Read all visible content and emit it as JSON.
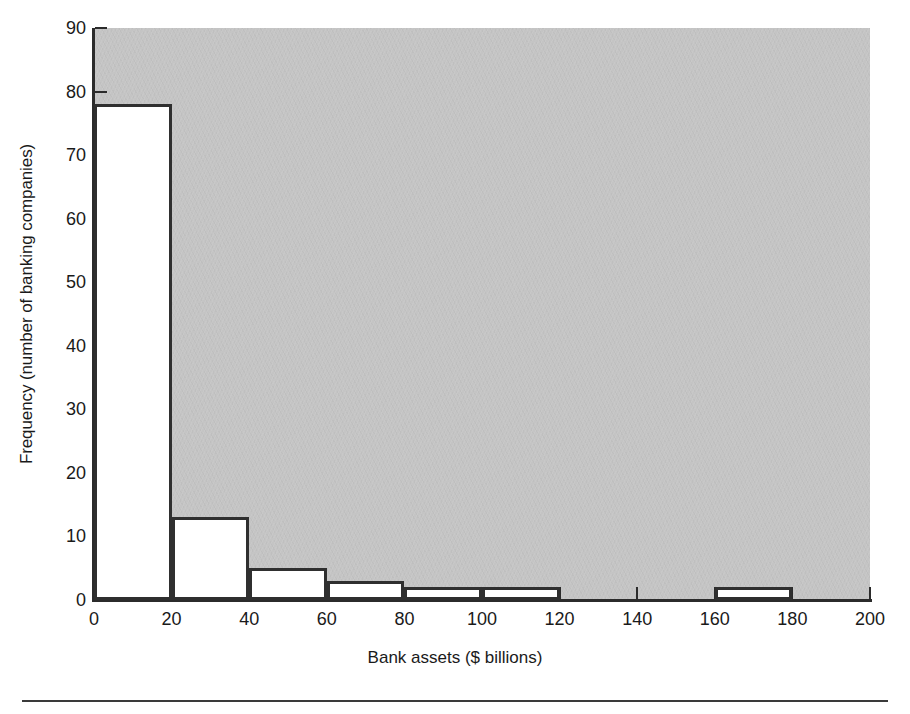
{
  "chart_data": {
    "type": "bar",
    "title": "",
    "subtitle": "",
    "xlabel": "Bank assets ($ billions)",
    "ylabel": "Frequency (number of banking companies)",
    "xlim": [
      0,
      200
    ],
    "ylim": [
      0,
      90
    ],
    "x_ticks": [
      0,
      20,
      40,
      60,
      80,
      100,
      120,
      140,
      160,
      180,
      200
    ],
    "x_tick_labels": [
      "0",
      "20",
      "40",
      "60",
      "80",
      "100",
      "120",
      "140",
      "160",
      "180",
      "200"
    ],
    "y_ticks": [
      0,
      10,
      20,
      30,
      40,
      50,
      60,
      70,
      80,
      90
    ],
    "y_tick_labels": [
      "0",
      "10",
      "20",
      "30",
      "40",
      "50",
      "60",
      "70",
      "80",
      "90"
    ],
    "grid": false,
    "legend": "none",
    "bin_width": 20,
    "bin_edges": [
      0,
      20,
      40,
      60,
      80,
      100,
      120,
      140,
      160,
      180,
      200
    ],
    "categories": [
      "0-20",
      "20-40",
      "40-60",
      "60-80",
      "80-100",
      "100-120",
      "120-140",
      "140-160",
      "160-180",
      "180-200"
    ],
    "values": [
      78,
      13,
      5,
      3,
      2,
      2,
      0,
      0,
      2,
      0
    ],
    "bars": [
      {
        "label": "0-20",
        "x0": 0,
        "x1": 20,
        "value": 78
      },
      {
        "label": "20-40",
        "x0": 20,
        "x1": 40,
        "value": 13
      },
      {
        "label": "40-60",
        "x0": 40,
        "x1": 60,
        "value": 5
      },
      {
        "label": "60-80",
        "x0": 60,
        "x1": 80,
        "value": 3
      },
      {
        "label": "80-100",
        "x0": 80,
        "x1": 100,
        "value": 2
      },
      {
        "label": "100-120",
        "x0": 100,
        "x1": 120,
        "value": 2
      },
      {
        "label": "120-140",
        "x0": 120,
        "x1": 140,
        "value": 0
      },
      {
        "label": "140-160",
        "x0": 140,
        "x1": 160,
        "value": 0
      },
      {
        "label": "160-180",
        "x0": 160,
        "x1": 180,
        "value": 2
      },
      {
        "label": "180-200",
        "x0": 180,
        "x1": 200,
        "value": 0
      }
    ],
    "colors": {
      "panel_background": "#c4c4c4",
      "bar_fill": "#ffffff",
      "bar_edge": "#2f2f2f",
      "axis": "#2b2b2b",
      "text": "#1a1a1a",
      "figure_background": "#ffffff",
      "rule": "#3a3a3a"
    }
  }
}
